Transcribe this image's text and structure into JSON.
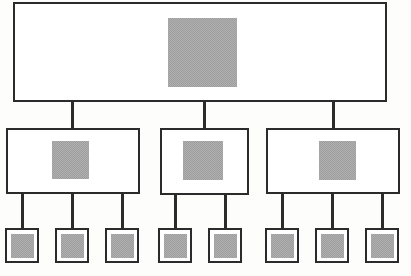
{
  "diagram": {
    "type": "hierarchy-tree",
    "canvas": {
      "width": 411,
      "height": 276,
      "background": "#fdfdfc"
    },
    "colors": {
      "outline": "#2b2b2b",
      "fill_gray": "#9e9e9e",
      "box_background": "#ffffff",
      "connector": "#2b2b2b"
    },
    "levels": [
      {
        "index": 1,
        "name": "root",
        "node_count": 1
      },
      {
        "index": 2,
        "name": "branch",
        "node_count": 3
      },
      {
        "index": 3,
        "name": "leaf",
        "node_count": 8
      }
    ],
    "nodes": {
      "root": [
        {
          "id": "root-1",
          "label": "",
          "box": {
            "x": 13,
            "y": 2,
            "w": 374,
            "h": 100
          },
          "fill": {
            "x": 168,
            "y": 18,
            "w": 69,
            "h": 69
          }
        }
      ],
      "branch": [
        {
          "id": "branch-1",
          "label": "",
          "box": {
            "x": 6,
            "y": 128,
            "w": 134,
            "h": 66
          },
          "fill": {
            "x": 52,
            "y": 141,
            "w": 37,
            "h": 38
          }
        },
        {
          "id": "branch-2",
          "label": "",
          "box": {
            "x": 160,
            "y": 128,
            "w": 89,
            "h": 67
          },
          "fill": {
            "x": 183,
            "y": 141,
            "w": 40,
            "h": 39
          }
        },
        {
          "id": "branch-3",
          "label": "",
          "box": {
            "x": 266,
            "y": 128,
            "w": 134,
            "h": 66
          },
          "fill": {
            "x": 319,
            "y": 141,
            "w": 37,
            "h": 39
          }
        }
      ],
      "leaf": [
        {
          "id": "leaf-1",
          "label": "",
          "parent": "branch-1",
          "box": {
            "x": 5,
            "y": 228,
            "w": 34,
            "h": 35
          },
          "fill": {
            "x": 11,
            "y": 234,
            "w": 23,
            "h": 24
          }
        },
        {
          "id": "leaf-2",
          "label": "",
          "parent": "branch-1",
          "box": {
            "x": 55,
            "y": 228,
            "w": 34,
            "h": 35
          },
          "fill": {
            "x": 61,
            "y": 234,
            "w": 23,
            "h": 24
          }
        },
        {
          "id": "leaf-3",
          "label": "",
          "parent": "branch-1",
          "box": {
            "x": 105,
            "y": 228,
            "w": 34,
            "h": 35
          },
          "fill": {
            "x": 111,
            "y": 234,
            "w": 23,
            "h": 24
          }
        },
        {
          "id": "leaf-4",
          "label": "",
          "parent": "branch-2",
          "box": {
            "x": 158,
            "y": 228,
            "w": 34,
            "h": 35
          },
          "fill": {
            "x": 164,
            "y": 234,
            "w": 23,
            "h": 24
          }
        },
        {
          "id": "leaf-5",
          "label": "",
          "parent": "branch-2",
          "box": {
            "x": 208,
            "y": 228,
            "w": 34,
            "h": 35
          },
          "fill": {
            "x": 214,
            "y": 234,
            "w": 23,
            "h": 24
          }
        },
        {
          "id": "leaf-6",
          "label": "",
          "parent": "branch-3",
          "box": {
            "x": 265,
            "y": 228,
            "w": 34,
            "h": 35
          },
          "fill": {
            "x": 271,
            "y": 234,
            "w": 23,
            "h": 24
          }
        },
        {
          "id": "leaf-7",
          "label": "",
          "parent": "branch-3",
          "box": {
            "x": 315,
            "y": 228,
            "w": 34,
            "h": 35
          },
          "fill": {
            "x": 321,
            "y": 234,
            "w": 23,
            "h": 24
          }
        },
        {
          "id": "leaf-8",
          "label": "",
          "parent": "branch-3",
          "box": {
            "x": 365,
            "y": 228,
            "w": 34,
            "h": 35
          },
          "fill": {
            "x": 371,
            "y": 234,
            "w": 23,
            "h": 24
          }
        }
      ]
    },
    "connectors": [
      {
        "id": "root-to-branch-1",
        "from": "root-1",
        "to": "branch-1",
        "orientation": "vertical",
        "x": 71,
        "y": 100,
        "length": 29
      },
      {
        "id": "root-to-branch-2",
        "from": "root-1",
        "to": "branch-2",
        "orientation": "vertical",
        "x": 203,
        "y": 100,
        "length": 29
      },
      {
        "id": "root-to-branch-3",
        "from": "root-1",
        "to": "branch-3",
        "orientation": "vertical",
        "x": 332,
        "y": 100,
        "length": 29
      },
      {
        "id": "branch-1-to-leaf-1",
        "from": "branch-1",
        "to": "leaf-1",
        "orientation": "vertical",
        "x": 21,
        "y": 192,
        "length": 37
      },
      {
        "id": "branch-1-to-leaf-2",
        "from": "branch-1",
        "to": "leaf-2",
        "orientation": "vertical",
        "x": 71,
        "y": 192,
        "length": 37
      },
      {
        "id": "branch-1-to-leaf-3",
        "from": "branch-1",
        "to": "leaf-3",
        "orientation": "vertical",
        "x": 121,
        "y": 192,
        "length": 37
      },
      {
        "id": "branch-2-to-leaf-4",
        "from": "branch-2",
        "to": "leaf-4",
        "orientation": "vertical",
        "x": 174,
        "y": 193,
        "length": 36
      },
      {
        "id": "branch-2-to-leaf-5",
        "from": "branch-2",
        "to": "leaf-5",
        "orientation": "vertical",
        "x": 224,
        "y": 193,
        "length": 36
      },
      {
        "id": "branch-3-to-leaf-6",
        "from": "branch-3",
        "to": "leaf-6",
        "orientation": "vertical",
        "x": 281,
        "y": 192,
        "length": 37
      },
      {
        "id": "branch-3-to-leaf-7",
        "from": "branch-3",
        "to": "leaf-7",
        "orientation": "vertical",
        "x": 331,
        "y": 192,
        "length": 37
      },
      {
        "id": "branch-3-to-leaf-8",
        "from": "branch-3",
        "to": "leaf-8",
        "orientation": "vertical",
        "x": 381,
        "y": 192,
        "length": 37
      }
    ]
  }
}
